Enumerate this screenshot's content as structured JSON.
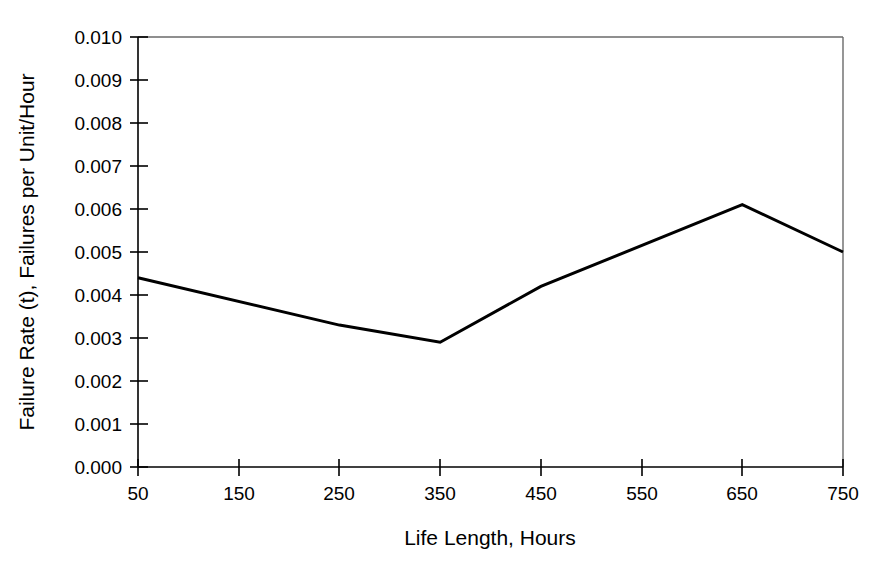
{
  "chart_data": {
    "type": "line",
    "title": "",
    "subtitle": "",
    "xlabel": "Life Length, Hours",
    "ylabel": "Failure Rate (t), Failures per Unit/Hour",
    "x": [
      50,
      250,
      350,
      450,
      650,
      750
    ],
    "values": [
      0.0044,
      0.0033,
      0.0029,
      0.0042,
      0.0061,
      0.005
    ],
    "series": [
      {
        "name": "Failure Rate",
        "color": "#000000",
        "x": [
          50,
          250,
          350,
          450,
          650,
          750
        ],
        "values": [
          0.0044,
          0.0033,
          0.0029,
          0.0042,
          0.0061,
          0.005
        ]
      }
    ],
    "xlim": [
      50,
      750
    ],
    "ylim": [
      0.0,
      0.01
    ],
    "xticks": [
      50,
      150,
      250,
      350,
      450,
      550,
      650,
      750
    ],
    "yticks": [
      0.0,
      0.001,
      0.002,
      0.003,
      0.004,
      0.005,
      0.006,
      0.007,
      0.008,
      0.009,
      0.01
    ],
    "xticklabels": [
      "50",
      "150",
      "250",
      "350",
      "450",
      "550",
      "650",
      "750"
    ],
    "yticklabels": [
      "0.000",
      "0.001",
      "0.002",
      "0.003",
      "0.004",
      "0.005",
      "0.006",
      "0.007",
      "0.008",
      "0.009",
      "0.010"
    ],
    "grid": false,
    "legend": null,
    "legend_position": "none",
    "annotations": [],
    "line_color": "#000000",
    "line_width": 3,
    "axis_color": "#000000",
    "frame_color": "#555555",
    "background": "#ffffff"
  },
  "axis_labels": {
    "x": "Life Length, Hours",
    "y": "Failure Rate (t), Failures per Unit/Hour"
  },
  "ytick_labels": {
    "t0": "0.010",
    "t1": "0.009",
    "t2": "0.008",
    "t3": "0.007",
    "t4": "0.006",
    "t5": "0.005",
    "t6": "0.004",
    "t7": "0.003",
    "t8": "0.002",
    "t9": "0.001",
    "t10": "0.000"
  },
  "xtick_labels": {
    "t0": "50",
    "t1": "150",
    "t2": "250",
    "t3": "350",
    "t4": "450",
    "t5": "550",
    "t6": "650",
    "t7": "750"
  }
}
